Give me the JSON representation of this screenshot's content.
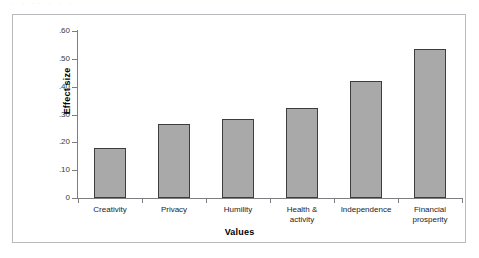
{
  "figure": {
    "top_caption_remnant": "· ·   ·· ·   ·         ·",
    "frame_color": "#b9b9bd",
    "background": "#ffffff"
  },
  "chart_data": {
    "type": "bar",
    "title": "",
    "subtitle": "",
    "xlabel": "Values",
    "ylabel": "Effect size",
    "categories": [
      "Creativity",
      "Privacy",
      "Humility",
      "Health &\nactivity",
      "Independence",
      "Financial\nprosperity"
    ],
    "values": [
      0.18,
      0.265,
      0.285,
      0.325,
      0.42,
      0.535
    ],
    "ylim": [
      0,
      0.6
    ],
    "ytick_values": [
      0,
      0.1,
      0.2,
      0.3,
      0.4,
      0.5,
      0.6
    ],
    "ytick_labels": [
      "0",
      ".10",
      ".20",
      ".30",
      ".40",
      ".50",
      ".60"
    ],
    "grid": false,
    "legend": null,
    "bar_fill_color": "#a9a9a9",
    "bar_edge_color": "#3d3d3d",
    "axis_color": "#7d7d82"
  }
}
